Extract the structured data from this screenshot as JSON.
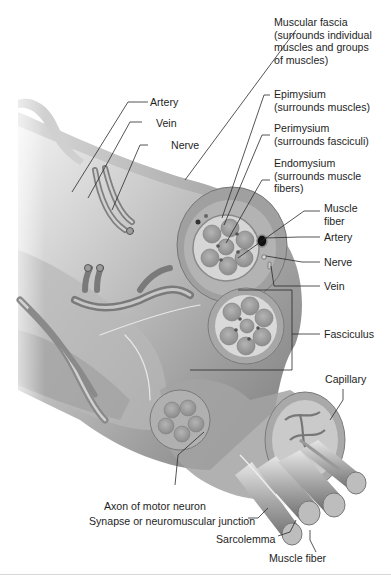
{
  "figure": {
    "colors": {
      "tissue_dark": "#8a8a8a",
      "tissue_mid": "#a9a9a9",
      "tissue_light": "#cfcfcf",
      "fascia": "#bdbdbd",
      "leader_line": "#2a2a2a",
      "text": "#1e1e1e"
    },
    "labels": {
      "muscular_fascia": "Muscular fascia\n(surrounds individual\nmuscles and groups\nof muscles)",
      "epimysium": "Epimysium\n(surrounds muscles)",
      "perimysium": "Perimysium\n(surrounds fasciculi)",
      "endomysium": "Endomysium\n(surrounds muscle\nfibers)",
      "muscle_fiber_right": "Muscle\nfiber",
      "artery_right": "Artery",
      "nerve_right": "Nerve",
      "vein_right": "Vein",
      "fasciculus": "Fasciculus",
      "capillary": "Capillary",
      "artery_left": "Artery",
      "vein_left": "Vein",
      "nerve_left": "Nerve",
      "axon": "Axon of motor neuron",
      "synapse": "Synapse or neuromuscular junction",
      "sarcolemma": "Sarcolemma",
      "muscle_fiber_bottom": "Muscle fiber"
    }
  }
}
